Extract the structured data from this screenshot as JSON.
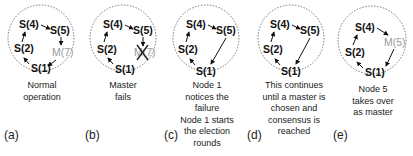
{
  "panels": [
    {
      "label": "(a)",
      "caption": [
        "Normal",
        "operation"
      ],
      "nodes": {
        "s4": "S(4)",
        "s5": "S(5)",
        "s2": "S(2)",
        "s1": "S(1)",
        "master": "M(7)"
      },
      "state": "normal"
    },
    {
      "label": "(b)",
      "caption": [
        "Master",
        "fails"
      ],
      "nodes": {
        "s4": "S(4)",
        "s5": "S(5)",
        "s2": "S(2)",
        "s1": "S(1)",
        "master": "M(7)"
      },
      "state": "master-failed",
      "failed_marker": "X"
    },
    {
      "label": "(c)",
      "caption": [
        "Node 1",
        "notices the",
        "failure",
        "Node 1 starts",
        "the election",
        "rounds"
      ],
      "nodes": {
        "s4": "S(4)",
        "s5": "S(5)",
        "s2": "S(2)",
        "s1": "S(1)"
      },
      "state": "election"
    },
    {
      "label": "(d)",
      "caption": [
        "This continues",
        "until a master is",
        "chosen and",
        "consensus is",
        "reached"
      ],
      "nodes": {
        "s4": "S(4)",
        "s5": "S(5)",
        "s2": "S(2)",
        "s1": "S(1)"
      },
      "state": "consensus"
    },
    {
      "label": "(e)",
      "caption": [
        "Node 5",
        "takes over",
        "as master"
      ],
      "nodes": {
        "s4": "S(4)",
        "s2": "S(2)",
        "s1": "S(1)",
        "master": "M(5)"
      },
      "state": "new-master"
    }
  ],
  "colors": {
    "node": "#111111",
    "master": "#9a9a9a",
    "circle": "#666666",
    "fail_x": "#222222"
  }
}
